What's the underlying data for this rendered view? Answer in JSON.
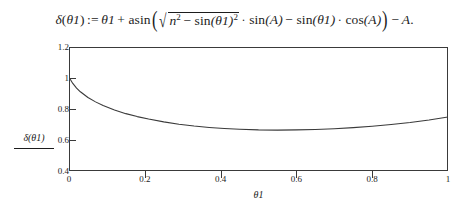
{
  "formula": {
    "lhs_fn": "δ",
    "lhs_arg_open": "(",
    "lhs_var": "θ1",
    "lhs_arg_close": ")",
    "assign": ":=",
    "term_theta": "θ1",
    "plus": "+",
    "asin": "asin",
    "paren_open": "(",
    "radical_sign": "√",
    "rad_n": "n",
    "rad_n_exp": "2",
    "rad_minus": "−",
    "rad_sin": "sin",
    "rad_sin_arg": "(θ1)",
    "rad_sin_exp": "2",
    "cdot1": "·",
    "sinA": "sin",
    "sinA_arg": "(A)",
    "minus1": "−",
    "sin_theta": "sin",
    "sin_theta_arg": "(θ1)",
    "cdot2": "·",
    "cosA": "cos",
    "cosA_arg": "(A)",
    "paren_close": ")",
    "minus2": "−",
    "tail_A": "A",
    "period": "."
  },
  "chart_data": {
    "type": "line",
    "title": "",
    "xlabel": "θ1",
    "ylabel": "δ(θ1)",
    "xlim": [
      0,
      1
    ],
    "ylim": [
      0.4,
      1.2
    ],
    "grid": false,
    "legend": null,
    "x_ticks": [
      "0",
      "0.2",
      "0.4",
      "0.6",
      "0.8",
      "1"
    ],
    "x_tick_values": [
      0,
      0.2,
      0.4,
      0.6,
      0.8,
      1
    ],
    "y_ticks": [
      "0.4",
      "0.6",
      "0.8",
      "1",
      "1.2"
    ],
    "y_tick_values": [
      0.4,
      0.6,
      0.8,
      1.0,
      1.2
    ],
    "line_color": "#3a3a3a",
    "series": [
      {
        "name": "δ(θ1)",
        "x": [
          0.0,
          0.01,
          0.02,
          0.03,
          0.05,
          0.07,
          0.09,
          0.12,
          0.15,
          0.18,
          0.21,
          0.25,
          0.29,
          0.33,
          0.37,
          0.41,
          0.45,
          0.5,
          0.55,
          0.6,
          0.65,
          0.7,
          0.75,
          0.8,
          0.85,
          0.9,
          0.95,
          1.0
        ],
        "y": [
          1.005,
          0.965,
          0.935,
          0.911,
          0.874,
          0.846,
          0.822,
          0.793,
          0.77,
          0.751,
          0.735,
          0.717,
          0.702,
          0.69,
          0.681,
          0.674,
          0.669,
          0.665,
          0.664,
          0.665,
          0.668,
          0.673,
          0.68,
          0.689,
          0.7,
          0.713,
          0.729,
          0.748
        ]
      }
    ]
  }
}
